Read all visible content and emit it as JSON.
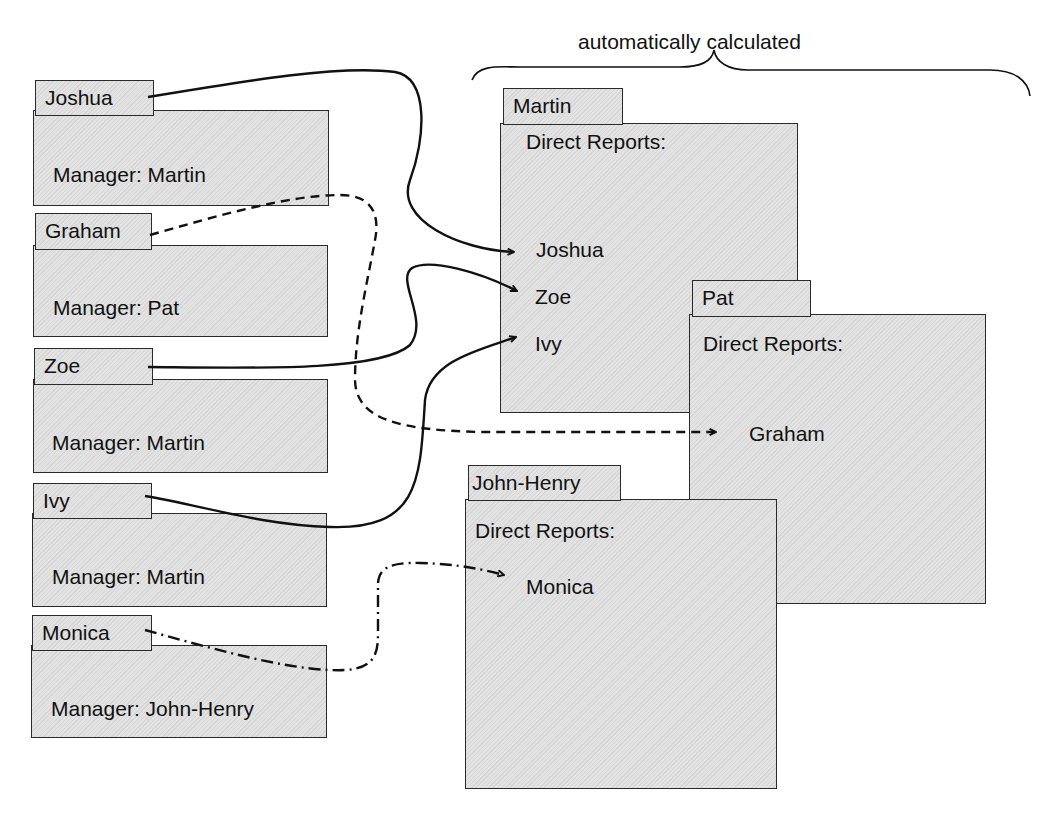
{
  "header": {
    "annotation": "automatically calculated"
  },
  "employees": [
    {
      "name": "Joshua",
      "manager_label": "Manager: Martin"
    },
    {
      "name": "Graham",
      "manager_label": "Manager: Pat"
    },
    {
      "name": "Zoe",
      "manager_label": "Manager: Martin"
    },
    {
      "name": "Ivy",
      "manager_label": "Manager: Martin"
    },
    {
      "name": "Monica",
      "manager_label": "Manager: John-Henry"
    }
  ],
  "managers": [
    {
      "name": "Martin",
      "reports_heading": "Direct Reports:",
      "reports": [
        "Joshua",
        "Zoe",
        "Ivy"
      ]
    },
    {
      "name": "Pat",
      "reports_heading": "Direct Reports:",
      "reports": [
        "Graham"
      ]
    },
    {
      "name": "John-Henry",
      "reports_heading": "Direct Reports:",
      "reports": [
        "Monica"
      ]
    }
  ],
  "connectors": [
    {
      "from": "Joshua",
      "to": "Martin",
      "style": "solid"
    },
    {
      "from": "Zoe",
      "to": "Martin",
      "style": "solid"
    },
    {
      "from": "Ivy",
      "to": "Martin",
      "style": "solid"
    },
    {
      "from": "Graham",
      "to": "Pat",
      "style": "dashed"
    },
    {
      "from": "Monica",
      "to": "John-Henry",
      "style": "dash-dot"
    }
  ]
}
